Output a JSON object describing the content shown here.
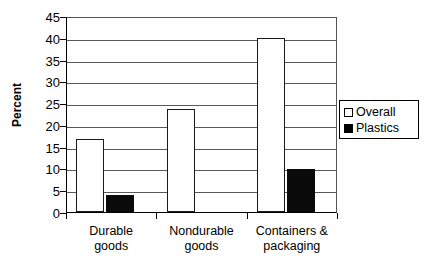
{
  "chart_data": {
    "type": "bar",
    "title": "",
    "xlabel": "",
    "ylabel": "Percent",
    "ylim": [
      0,
      45
    ],
    "ytick_step": 5,
    "yticks": [
      0,
      5,
      10,
      15,
      20,
      25,
      30,
      35,
      40,
      45
    ],
    "ytick_labels": [
      "0",
      "5",
      "10",
      "15",
      "20",
      "25",
      "30",
      "35",
      "40",
      "45"
    ],
    "grid": "horizontal",
    "legend_position": "right-outside",
    "categories": [
      "Durable goods",
      "Nondurable goods",
      "Containers & packaging"
    ],
    "category_lines": [
      [
        "Durable",
        "goods"
      ],
      [
        "Nondurable",
        "goods"
      ],
      [
        "Containers &",
        "packaging"
      ]
    ],
    "series": [
      {
        "name": "Overall",
        "color": "#ffffff",
        "edge_color": "#1a1a1a",
        "values": [
          16.7,
          23.7,
          40.0
        ]
      },
      {
        "name": "Plastics",
        "color": "#000000",
        "edge_color": "#000000",
        "values": [
          3.9,
          0,
          9.8
        ]
      }
    ]
  },
  "legend": {
    "items": [
      {
        "label": "Overall",
        "swatch": "white-square-swatch"
      },
      {
        "label": "Plastics",
        "swatch": "black-square-swatch"
      }
    ]
  },
  "colors": {
    "axis": "#000000",
    "gridline": "#5a5a5a",
    "background": "#ffffff",
    "overall_fill": "#ffffff",
    "plastics_fill": "#000000"
  }
}
